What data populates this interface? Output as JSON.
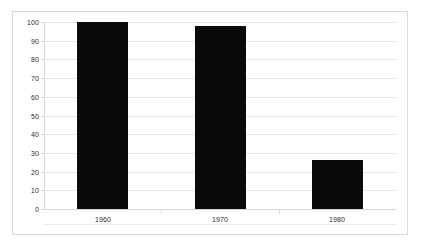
{
  "chart_data": {
    "type": "bar",
    "title": "",
    "subtitle": "",
    "xlabel": "",
    "ylabel": "",
    "categories": [
      "1960",
      "1970",
      "1980"
    ],
    "values": [
      100,
      98,
      26
    ],
    "series": [
      {
        "name": "",
        "values": [
          100,
          98,
          26
        ],
        "color": "#0a0a0a"
      }
    ],
    "ylim": [
      0,
      100
    ],
    "y_ticks": [
      0,
      10,
      20,
      30,
      40,
      50,
      60,
      70,
      80,
      90,
      100
    ],
    "y_tick_labels": [
      "0",
      "10",
      "20",
      "30",
      "40",
      "50",
      "60",
      "70",
      "80",
      "90",
      "100"
    ],
    "grid": true,
    "grid_axis": "y",
    "legend": false,
    "legend_position": "none",
    "bar_color": "#0a0a0a",
    "gridline_color": "#e8e8e8",
    "axis_color": "#d6d6d6",
    "border_color": "#d9d9d9",
    "background_color": "#ffffff",
    "text_color": "#2b2b2b"
  }
}
